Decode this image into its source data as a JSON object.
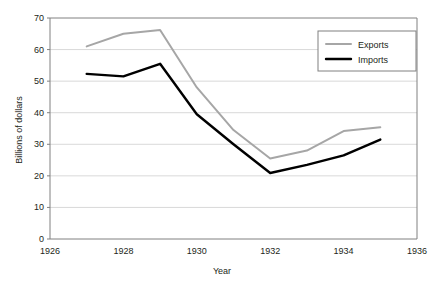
{
  "chart_data": {
    "type": "line",
    "title": "",
    "xlabel": "Year",
    "ylabel": "Billions of dollars",
    "xlim": [
      1926,
      1936
    ],
    "ylim": [
      0,
      70
    ],
    "grid": true,
    "legend_position": "top-right",
    "x": [
      1927,
      1928,
      1929,
      1930,
      1931,
      1932,
      1933,
      1934,
      1935
    ],
    "xticks": [
      "1926",
      "1928",
      "1930",
      "1932",
      "1934",
      "1936"
    ],
    "xtick_values": [
      1926,
      1928,
      1930,
      1932,
      1934,
      1936
    ],
    "yticks": [
      "0",
      "10",
      "20",
      "30",
      "40",
      "50",
      "60",
      "70"
    ],
    "ytick_values": [
      0,
      10,
      20,
      30,
      40,
      50,
      60,
      70
    ],
    "series": [
      {
        "name": "Exports",
        "color": "#a6a6a6",
        "values": [
          61.0,
          65.0,
          66.2,
          48.0,
          34.5,
          25.5,
          28.0,
          34.2,
          35.4
        ]
      },
      {
        "name": "Imports",
        "color": "#000000",
        "values": [
          52.3,
          51.5,
          55.5,
          39.5,
          30.0,
          20.9,
          23.5,
          26.5,
          31.5
        ]
      }
    ]
  },
  "axes": {
    "y_title": "Billions of dollars",
    "x_title": "Year"
  },
  "legend": {
    "items": [
      {
        "label": "Exports",
        "color": "#a6a6a6"
      },
      {
        "label": "Imports",
        "color": "#000000"
      }
    ]
  },
  "style": {
    "frame_color": "#808080",
    "grid_color": "#d9d9d9",
    "text_color": "#231f20",
    "background": "#ffffff"
  }
}
